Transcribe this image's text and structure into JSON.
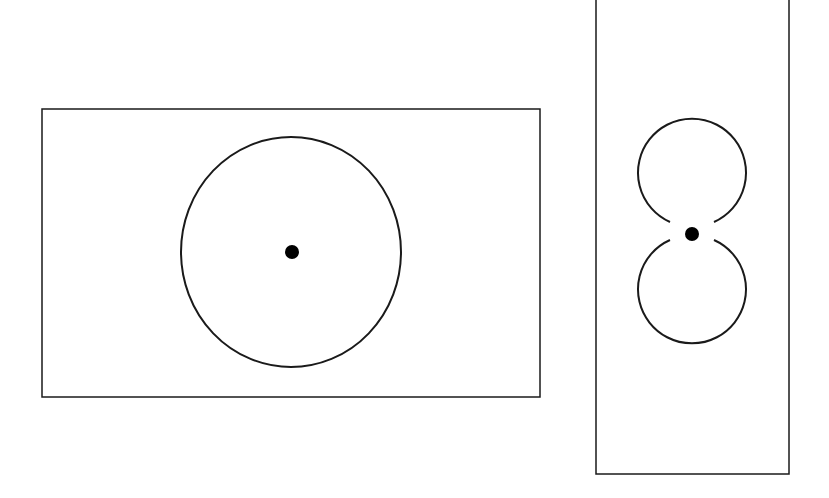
{
  "diagram": {
    "stroke_color": "#1a1a1a",
    "fill_color": "#000000",
    "background": "#ffffff",
    "panels": [
      {
        "name": "left-panel",
        "rect": {
          "x": 42,
          "y": 109,
          "w": 498,
          "h": 288
        },
        "shapes": [
          {
            "type": "ellipse",
            "cx": 291,
            "cy": 252,
            "rx": 110,
            "ry": 115
          },
          {
            "type": "dot",
            "cx": 292,
            "cy": 252,
            "r": 7
          }
        ]
      },
      {
        "name": "right-panel",
        "rect": {
          "x": 596,
          "y": -2,
          "w": 193,
          "h": 476
        },
        "shapes": [
          {
            "type": "open-circle-top",
            "cx": 692,
            "cy": 173,
            "r": 54
          },
          {
            "type": "open-circle-bottom",
            "cx": 692,
            "cy": 290,
            "r": 54
          },
          {
            "type": "dot",
            "cx": 692,
            "cy": 234,
            "r": 7
          }
        ]
      }
    ]
  }
}
